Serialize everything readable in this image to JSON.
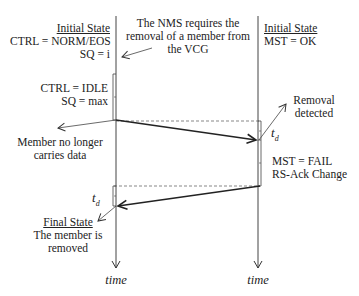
{
  "diagram": {
    "type": "sequence-timing",
    "left_lane": {
      "initial_state": {
        "heading": "Initial State",
        "line1": "CTRL = NORM/EOS",
        "line2": "SQ = i"
      },
      "idle_state": {
        "line1": "CTRL = IDLE",
        "line2": "SQ = max"
      },
      "annotation_no_data": {
        "line1": "Member no longer",
        "line2": "carries data"
      },
      "delay_label": "t",
      "delay_subscript": "d",
      "final_state": {
        "heading": "Final State",
        "line1": "The member  is",
        "line2": "removed"
      },
      "time_label": "time"
    },
    "right_lane": {
      "initial_state": {
        "heading": "Initial State",
        "line1": "MST = OK"
      },
      "annotation_removal": {
        "line1": "Removal",
        "line2": "detected"
      },
      "delay_label": "t",
      "delay_subscript": "d",
      "fail_state": {
        "line1": "MST = FAIL",
        "line2": "RS-Ack Change"
      },
      "time_label": "time"
    },
    "nms_note": {
      "line1": "The NMS requires  the",
      "line2": "removal of a member  from",
      "line3": "the VCG"
    },
    "colors": {
      "line": "#333333",
      "text": "#222222",
      "background": "#ffffff"
    }
  }
}
